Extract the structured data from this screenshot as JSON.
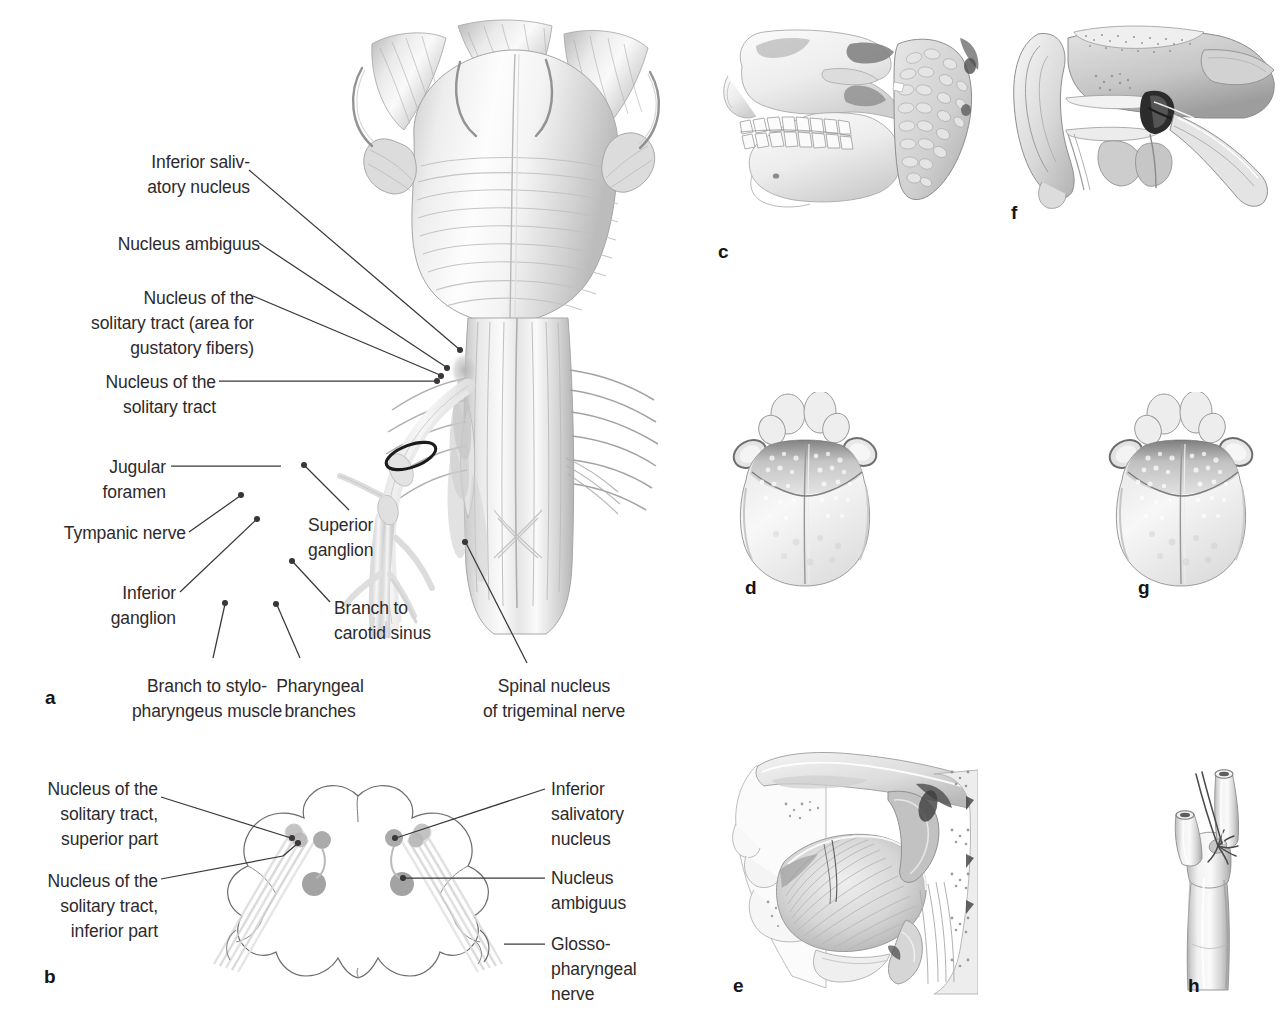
{
  "figure": {
    "background": "#ffffff",
    "ink": "#2e2a2b",
    "leader_color": "#3b3738",
    "nucleus_gray": "#9d9d9d",
    "nucleus_pale": "#d7d7d7"
  },
  "panel_a": {
    "letter": "a",
    "labels_left": [
      {
        "id": "inferior-salivatory-nucleus",
        "lines": [
          "Inferior saliv-",
          "atory nucleus"
        ]
      },
      {
        "id": "nucleus-ambiguus",
        "lines": [
          "Nucleus ambiguus"
        ]
      },
      {
        "id": "nucleus-solitary-tract-gustatory",
        "lines": [
          "Nucleus of the",
          "solitary tract (area for",
          "gustatory fibers)"
        ]
      },
      {
        "id": "nucleus-solitary-tract",
        "lines": [
          "Nucleus of the",
          "solitary tract"
        ]
      },
      {
        "id": "jugular-foramen",
        "lines": [
          "Jugular",
          "foramen"
        ]
      },
      {
        "id": "tympanic-nerve",
        "lines": [
          "Tympanic nerve"
        ]
      },
      {
        "id": "inferior-ganglion",
        "lines": [
          "Inferior",
          "ganglion"
        ]
      }
    ],
    "labels_right": [
      {
        "id": "superior-ganglion",
        "lines": [
          "Superior",
          "ganglion"
        ]
      },
      {
        "id": "branch-to-carotid-sinus",
        "lines": [
          "Branch to",
          "carotid sinus"
        ]
      }
    ],
    "labels_bottom": [
      {
        "id": "branch-to-stylopharyngeus-muscle",
        "lines": [
          "Branch to stylo-",
          "pharyngeus muscle"
        ]
      },
      {
        "id": "pharyngeal-branches",
        "lines": [
          "Pharyngeal",
          "branches"
        ]
      },
      {
        "id": "spinal-nucleus-of-trigeminal-nerve",
        "lines": [
          "Spinal nucleus",
          "of trigeminal nerve"
        ]
      }
    ]
  },
  "panel_b": {
    "letter": "b",
    "labels_left": [
      {
        "id": "nucleus-solitary-tract-superior-part",
        "lines": [
          "Nucleus of the",
          "solitary tract,",
          "superior part"
        ]
      },
      {
        "id": "nucleus-solitary-tract-inferior-part",
        "lines": [
          "Nucleus of the",
          "solitary tract,",
          "inferior part"
        ]
      }
    ],
    "labels_right": [
      {
        "id": "inferior-salivatory-nucleus",
        "lines": [
          "Inferior",
          "salivatory",
          "nucleus"
        ]
      },
      {
        "id": "nucleus-ambiguus",
        "lines": [
          "Nucleus",
          "ambiguus"
        ]
      },
      {
        "id": "glossopharyngeal-nerve",
        "lines": [
          "Glosso-",
          "pharyngeal",
          "nerve"
        ]
      }
    ]
  },
  "panel_c": {
    "letter": "c",
    "subject": "skull lateral view with parotid gland"
  },
  "panel_d": {
    "letter": "d",
    "subject": "tongue dorsal surface, posterior third"
  },
  "panel_e": {
    "letter": "e",
    "subject": "midsagittal section of oral cavity and pharynx"
  },
  "panel_f": {
    "letter": "f",
    "subject": "external ear, tympanic cavity and auditory tube"
  },
  "panel_g": {
    "letter": "g",
    "subject": "tongue dorsal surface, taste territory"
  },
  "panel_h": {
    "letter": "h",
    "subject": "carotid bifurcation with carotid sinus and body"
  }
}
